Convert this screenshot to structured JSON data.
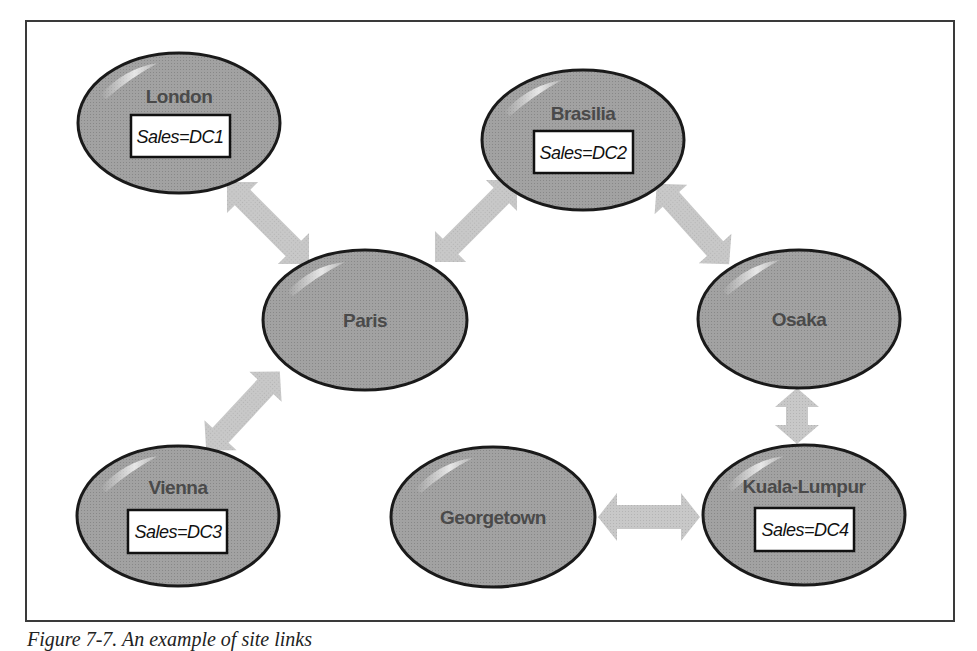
{
  "colors": {
    "node_fill": "#9a9a9a",
    "node_stroke": "#1a1a1a",
    "arrow_fill": "#c4c4c4",
    "label_text": "#4a4a4a",
    "frame": "#3a3a3a"
  },
  "nodes": [
    {
      "id": "london",
      "label": "London",
      "sales": "Sales=DC1"
    },
    {
      "id": "brasilia",
      "label": "Brasilia",
      "sales": "Sales=DC2"
    },
    {
      "id": "paris",
      "label": "Paris"
    },
    {
      "id": "osaka",
      "label": "Osaka"
    },
    {
      "id": "vienna",
      "label": "Vienna",
      "sales": "Sales=DC3"
    },
    {
      "id": "georgetown",
      "label": "Georgetown"
    },
    {
      "id": "kuala-lumpur",
      "label": "Kuala-Lumpur",
      "sales": "Sales=DC4"
    }
  ],
  "links": [
    {
      "from": "London",
      "to": "Paris"
    },
    {
      "from": "Paris",
      "to": "Brasilia"
    },
    {
      "from": "Brasilia",
      "to": "Osaka"
    },
    {
      "from": "Paris",
      "to": "Vienna"
    },
    {
      "from": "Osaka",
      "to": "Kuala-Lumpur"
    },
    {
      "from": "Georgetown",
      "to": "Kuala-Lumpur"
    }
  ],
  "caption": "Figure 7-7. An example of site links"
}
